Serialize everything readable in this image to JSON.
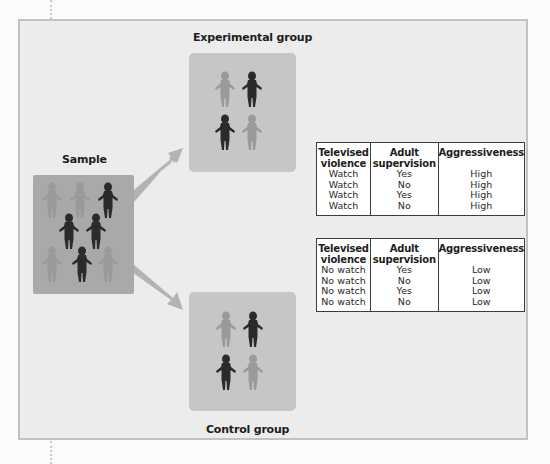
{
  "diagram": {
    "sample": {
      "label": "Sample",
      "figures": [
        {
          "x": 41,
          "y": 182,
          "shade": "light"
        },
        {
          "x": 69,
          "y": 182,
          "shade": "light"
        },
        {
          "x": 97,
          "y": 182,
          "shade": "dark"
        },
        {
          "x": 58,
          "y": 213,
          "shade": "dark"
        },
        {
          "x": 85,
          "y": 213,
          "shade": "dark"
        },
        {
          "x": 41,
          "y": 246,
          "shade": "light"
        },
        {
          "x": 71,
          "y": 246,
          "shade": "dark"
        },
        {
          "x": 97,
          "y": 246,
          "shade": "light"
        }
      ]
    },
    "experimental_group": {
      "label": "Experimental group",
      "figures": [
        {
          "x": 214,
          "y": 71,
          "shade": "light"
        },
        {
          "x": 241,
          "y": 71,
          "shade": "dark"
        },
        {
          "x": 214,
          "y": 114,
          "shade": "dark"
        },
        {
          "x": 241,
          "y": 114,
          "shade": "light"
        }
      ]
    },
    "control_group": {
      "label": "Control group",
      "figures": [
        {
          "x": 215,
          "y": 311,
          "shade": "light"
        },
        {
          "x": 242,
          "y": 311,
          "shade": "dark"
        },
        {
          "x": 215,
          "y": 354,
          "shade": "dark"
        },
        {
          "x": 242,
          "y": 354,
          "shade": "light"
        }
      ]
    },
    "arrows": [
      {
        "from": "sample",
        "to": "experimental_group"
      },
      {
        "from": "sample",
        "to": "control_group"
      }
    ],
    "colors": {
      "panel_bg": "#ececec",
      "panel_border": "#c2c2c2",
      "sample_box": "#a9a9a9",
      "group_box": "#c6c6c6",
      "arrow": "#b3b3b3",
      "figure_dark": "#2b2b2b",
      "figure_light": "#9a9a9a"
    }
  },
  "tables": [
    {
      "name": "experimental",
      "headers": [
        "Televised violence",
        "Adult supervision",
        "Aggressiveness"
      ],
      "header_lines": [
        [
          "Televised",
          "violence"
        ],
        [
          "Adult",
          "supervision"
        ],
        [
          "Aggressiveness"
        ]
      ],
      "rows": [
        [
          "Watch",
          "Yes",
          "High"
        ],
        [
          "Watch",
          "No",
          "High"
        ],
        [
          "Watch",
          "Yes",
          "High"
        ],
        [
          "Watch",
          "No",
          "High"
        ]
      ]
    },
    {
      "name": "control",
      "headers": [
        "Televised violence",
        "Adult supervision",
        "Aggressiveness"
      ],
      "header_lines": [
        [
          "Televised",
          "violence"
        ],
        [
          "Adult",
          "supervision"
        ],
        [
          "Aggressiveness"
        ]
      ],
      "rows": [
        [
          "No watch",
          "Yes",
          "Low"
        ],
        [
          "No watch",
          "No",
          "Low"
        ],
        [
          "No watch",
          "Yes",
          "Low"
        ],
        [
          "No watch",
          "No",
          "Low"
        ]
      ]
    }
  ]
}
